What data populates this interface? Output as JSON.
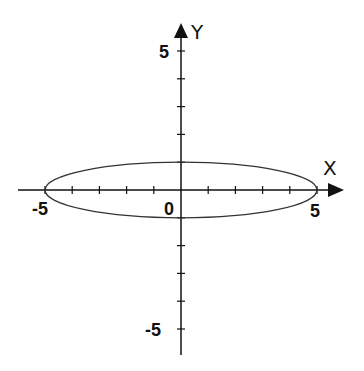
{
  "chart_data": {
    "type": "line",
    "title": "",
    "xlabel": "X",
    "ylabel": "Y",
    "xlim": [
      -5.5,
      5.5
    ],
    "ylim": [
      -6,
      5.5
    ],
    "grid": false,
    "x_tick_labels": [
      "-5",
      "0",
      "5"
    ],
    "y_tick_labels": [
      "5",
      "-5"
    ],
    "x_ticks": [
      -5,
      -4,
      -3,
      -2,
      -1,
      0,
      1,
      2,
      3,
      4,
      5
    ],
    "y_ticks": [
      5,
      4,
      3,
      2,
      1,
      0,
      -1,
      -2,
      -3,
      -4,
      -5
    ],
    "series": [
      {
        "name": "ellipse",
        "equation": "x^2/25 + y^2/1 = 1",
        "center": [
          0,
          0
        ],
        "semi_major_x": 5,
        "semi_minor_y": 1,
        "color": "#333333"
      }
    ]
  },
  "labels": {
    "x_axis": "X",
    "y_axis": "Y",
    "origin": "0",
    "x_neg5": "-5",
    "x_pos5": "5",
    "y_pos5": "5",
    "y_neg5": "-5"
  }
}
